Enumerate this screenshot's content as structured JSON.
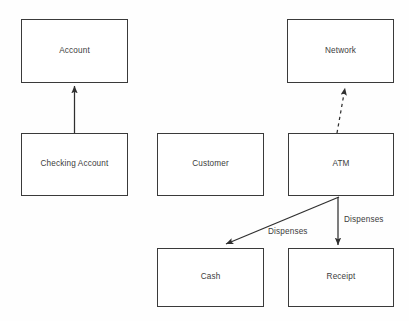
{
  "diagram": {
    "type": "uml-class-diagram",
    "width": 409,
    "height": 321,
    "background_color": "#fefefe",
    "line_color": "#3a3a3a",
    "text_color": "#3c3c3c",
    "nodes": [
      {
        "id": "account",
        "label": "Account"
      },
      {
        "id": "checking_account",
        "label": "Checking Account"
      },
      {
        "id": "customer",
        "label": "Customer"
      },
      {
        "id": "network",
        "label": "Network"
      },
      {
        "id": "atm",
        "label": "ATM"
      },
      {
        "id": "cash",
        "label": "Cash"
      },
      {
        "id": "receipt",
        "label": "Receipt"
      }
    ],
    "edges": [
      {
        "id": "checking_account_to_account",
        "from": "checking_account",
        "to": "account",
        "label": "",
        "style": "solid",
        "arrowhead": "filled"
      },
      {
        "id": "atm_to_network",
        "from": "atm",
        "to": "network",
        "label": "",
        "style": "dashed",
        "arrowhead": "filled"
      },
      {
        "id": "atm_to_cash",
        "from": "atm",
        "to": "cash",
        "label": "Dispenses",
        "style": "solid",
        "arrowhead": "filled"
      },
      {
        "id": "atm_to_receipt",
        "from": "atm",
        "to": "receipt",
        "label": "Dispenses",
        "style": "solid",
        "arrowhead": "filled"
      }
    ]
  }
}
